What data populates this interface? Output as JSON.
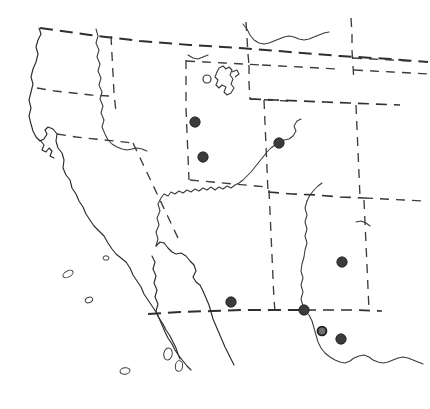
{
  "figure": {
    "background_color": "#ffffff",
    "width": 430,
    "height": 409,
    "style": "scanned line-drawing outline map",
    "alt_text": "Outline map of the southwestern United States and northern Mexico with dashed state and international boundaries, solid coastlines and rivers, and filled circles marking collection localities."
  },
  "legend_colors": {
    "locality_dot": "#3b3b3b",
    "boundary_line": "#313131",
    "coastline": "#2b2b2b",
    "open_symbol_fill": "#ffffff"
  },
  "map_data": {
    "type": "point-distribution",
    "symbol_counts": {
      "filled_dots": 8,
      "open_circles": 1
    },
    "localities": [
      {
        "id": "loc-1",
        "region": "northern-utah",
        "x": 195,
        "y": 122,
        "symbol": "filled",
        "radius": 5.2
      },
      {
        "id": "loc-2",
        "region": "central-utah",
        "x": 203,
        "y": 157,
        "symbol": "filled",
        "radius": 5.2
      },
      {
        "id": "loc-3",
        "region": "western-colorado",
        "x": 279,
        "y": 143,
        "symbol": "filled",
        "radius": 5.2
      },
      {
        "id": "loc-4",
        "region": "southern-arizona",
        "x": 231,
        "y": 302,
        "symbol": "filled",
        "radius": 5.2
      },
      {
        "id": "loc-5",
        "region": "central-new-mexico",
        "x": 342,
        "y": 262,
        "symbol": "filled",
        "radius": 5.2
      },
      {
        "id": "loc-6",
        "region": "southwestern-new-mexico-border",
        "x": 304,
        "y": 310,
        "symbol": "filled",
        "radius": 5.2
      },
      {
        "id": "loc-7",
        "region": "rio-grande-el-paso",
        "x": 322,
        "y": 331,
        "symbol": "ring",
        "radius": 4.4
      },
      {
        "id": "loc-8",
        "region": "west-texas-chihuahua",
        "x": 341,
        "y": 339,
        "symbol": "filled",
        "radius": 5.2
      }
    ],
    "open_symbols": [
      {
        "id": "open-1",
        "region": "great-salt-lake-area",
        "x": 207,
        "y": 79,
        "symbol": "open-circle",
        "radius": 4.0
      }
    ],
    "features": {
      "lakes": [
        "great-salt-lake"
      ],
      "coastlines": [
        "pacific-coast",
        "baja-california-peninsula",
        "gulf-of-california"
      ],
      "rivers": [
        "colorado-river",
        "rio-grande",
        "green-river"
      ],
      "islands": 6
    }
  }
}
